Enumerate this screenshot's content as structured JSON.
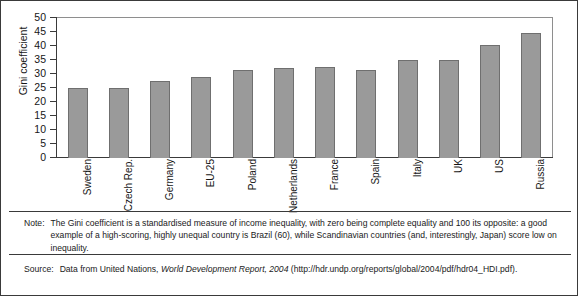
{
  "chart_data": {
    "type": "bar",
    "title": "",
    "xlabel": "",
    "ylabel": "Gini coefficient",
    "ylim": [
      0,
      50
    ],
    "yticks": [
      0,
      5,
      10,
      15,
      20,
      25,
      30,
      35,
      40,
      45,
      50
    ],
    "grid": false,
    "legend": "none",
    "bar_color": "#9a9a9a",
    "bar_edge_color": "#6f6f6f",
    "categories": [
      "Sweden",
      "Czech Rep.",
      "Germany",
      "EU-25",
      "Poland",
      "Netherlands",
      "France",
      "Spain",
      "Italy",
      "UK",
      "US",
      "Russia"
    ],
    "values": [
      25,
      25,
      27.5,
      29,
      31.5,
      32,
      32.5,
      31.5,
      35,
      35,
      40.5,
      44.5
    ]
  },
  "footnotes": {
    "note_label": "Note:",
    "note_text": "The Gini coefficient is a standardised measure of income inequality, with zero being complete equality and 100 its opposite: a good example of a high-scoring, highly unequal country is Brazil (60), while Scandinavian countries (and, interestingly, Japan) score low on inequality.",
    "source_label": "Source:",
    "source_prefix": "Data from United Nations, ",
    "source_title": "World Development Report, 2004",
    "source_suffix": " (http://hdr.undp.org/reports/global/2004/pdf/hdr04_HDI.pdf)."
  }
}
